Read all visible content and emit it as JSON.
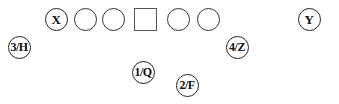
{
  "diagram": {
    "type": "football-formation",
    "offensive_line": [
      {
        "id": "x",
        "label": "X",
        "shape": "circle",
        "cx": 56,
        "cy": 19,
        "size": 23
      },
      {
        "id": "lineman-1",
        "label": "",
        "shape": "circle",
        "cx": 85,
        "cy": 19,
        "size": 23
      },
      {
        "id": "lineman-2",
        "label": "",
        "shape": "circle",
        "cx": 113,
        "cy": 19,
        "size": 23
      },
      {
        "id": "center",
        "label": "",
        "shape": "square",
        "cx": 145,
        "cy": 19,
        "size": 23
      },
      {
        "id": "lineman-3",
        "label": "",
        "shape": "circle",
        "cx": 178,
        "cy": 19,
        "size": 23
      },
      {
        "id": "lineman-4",
        "label": "",
        "shape": "circle",
        "cx": 208,
        "cy": 19,
        "size": 23
      },
      {
        "id": "y",
        "label": "Y",
        "shape": "circle",
        "cx": 309,
        "cy": 19,
        "size": 23
      }
    ],
    "backfield": [
      {
        "id": "3-h",
        "label": "3/H",
        "shape": "circle",
        "cx": 19,
        "cy": 47,
        "size": 23
      },
      {
        "id": "4-z",
        "label": "4/Z",
        "shape": "circle",
        "cx": 237,
        "cy": 47,
        "size": 23
      },
      {
        "id": "1-q",
        "label": "1/Q",
        "shape": "circle",
        "cx": 143,
        "cy": 72,
        "size": 23
      },
      {
        "id": "2-f",
        "label": "2/F",
        "shape": "circle",
        "cx": 187,
        "cy": 85,
        "size": 23
      }
    ]
  }
}
